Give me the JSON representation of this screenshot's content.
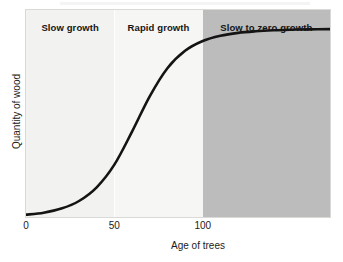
{
  "chart_data": {
    "type": "line",
    "title": "",
    "xlabel": "Age of trees",
    "ylabel": "Quantity of wood",
    "xlim": [
      0,
      172
    ],
    "ylim": [
      0,
      1.06
    ],
    "grid": false,
    "legend": "none",
    "xticks": [
      {
        "value": 0,
        "label": "0"
      },
      {
        "value": 50,
        "label": "50"
      },
      {
        "value": 100,
        "label": "100"
      }
    ],
    "yticks": [],
    "series": [
      {
        "name": "Quantity of wood",
        "color": "#141414",
        "x": [
          0,
          10,
          20,
          30,
          40,
          50,
          60,
          70,
          80,
          90,
          100,
          110,
          120,
          130,
          140,
          150,
          160,
          172
        ],
        "y": [
          0.012,
          0.022,
          0.043,
          0.082,
          0.152,
          0.268,
          0.437,
          0.618,
          0.762,
          0.851,
          0.901,
          0.928,
          0.943,
          0.951,
          0.956,
          0.959,
          0.961,
          0.962
        ]
      }
    ],
    "regions": [
      {
        "label": "Slow growth",
        "x_start": 0,
        "x_end": 50,
        "fill": "#f2f2f0"
      },
      {
        "label": "Rapid growth",
        "x_start": 50,
        "x_end": 100,
        "fill": "#f6f6f4"
      },
      {
        "label": "Slow to zero growth",
        "x_start": 100,
        "x_end": 172,
        "fill": "#bcbcbc"
      }
    ],
    "annotations": [
      {
        "text": "Slow growth",
        "role": "region-label"
      },
      {
        "text": "Rapid growth",
        "role": "region-label"
      },
      {
        "text": "Slow to zero growth",
        "role": "region-label"
      }
    ]
  },
  "colors": {
    "curve": "#141414",
    "region_light": "#f2f2f0",
    "region_mid": "#f6f6f4",
    "region_dark": "#bcbcbc",
    "text": "#1b1b1b",
    "background": "#ffffff"
  }
}
